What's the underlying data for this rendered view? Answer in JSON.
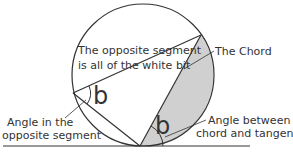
{
  "diagram": {
    "labels": {
      "opposite_segment_line1": "The opposite segment",
      "opposite_segment_line2": "is all of the white bit",
      "chord": "The Chord",
      "angle_opposite_line1": "Angle in the",
      "angle_opposite_line2": "opposite segment",
      "angle_tangent_line1": "Angle between",
      "angle_tangent_line2": "chord and tangent",
      "angle_symbol_left": "b",
      "angle_symbol_bottom": "b"
    },
    "colors": {
      "stroke": "#333333",
      "shade": "#d0d0d0",
      "background": "#ffffff"
    }
  }
}
